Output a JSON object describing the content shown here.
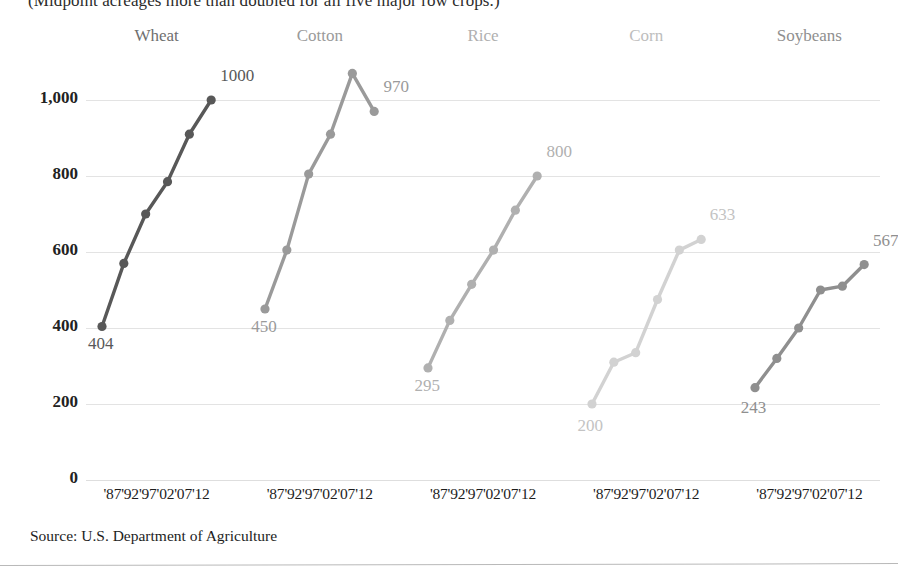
{
  "kicker": "(Midpoint acreages more than doubled for all five major row crops.)",
  "source": "Source: U.S. Department of Agriculture",
  "yticks": [
    "1,000",
    "800",
    "600",
    "400",
    "200",
    "0"
  ],
  "xticks": "'87'92'97'02'07'12",
  "chart_data": {
    "type": "line",
    "title": "(Midpoint acreages more than doubled for all five major row crops.)",
    "xlabel": "",
    "ylabel": "",
    "ylim": [
      0,
      1100
    ],
    "grid": true,
    "legend": "panel-titles",
    "x": [
      "'87",
      "'92",
      "'97",
      "'02",
      "'07",
      "'12"
    ],
    "panels": [
      {
        "name": "Wheat",
        "color": "#585858",
        "values": [
          404,
          570,
          700,
          785,
          910,
          1000
        ],
        "start_label": "404",
        "end_label": "1000"
      },
      {
        "name": "Cotton",
        "color": "#9a9a9a",
        "values": [
          450,
          605,
          805,
          910,
          1070,
          970
        ],
        "start_label": "450",
        "end_label": "970"
      },
      {
        "name": "Rice",
        "color": "#b0b0b0",
        "values": [
          295,
          420,
          515,
          605,
          710,
          800
        ],
        "start_label": "295",
        "end_label": "800"
      },
      {
        "name": "Corn",
        "color": "#d2d2d2",
        "values": [
          200,
          310,
          335,
          475,
          605,
          633
        ],
        "start_label": "200",
        "end_label": "633"
      },
      {
        "name": "Soybeans",
        "color": "#8f8f8f",
        "values": [
          243,
          320,
          400,
          500,
          510,
          567
        ],
        "start_label": "243",
        "end_label": "567"
      }
    ]
  }
}
